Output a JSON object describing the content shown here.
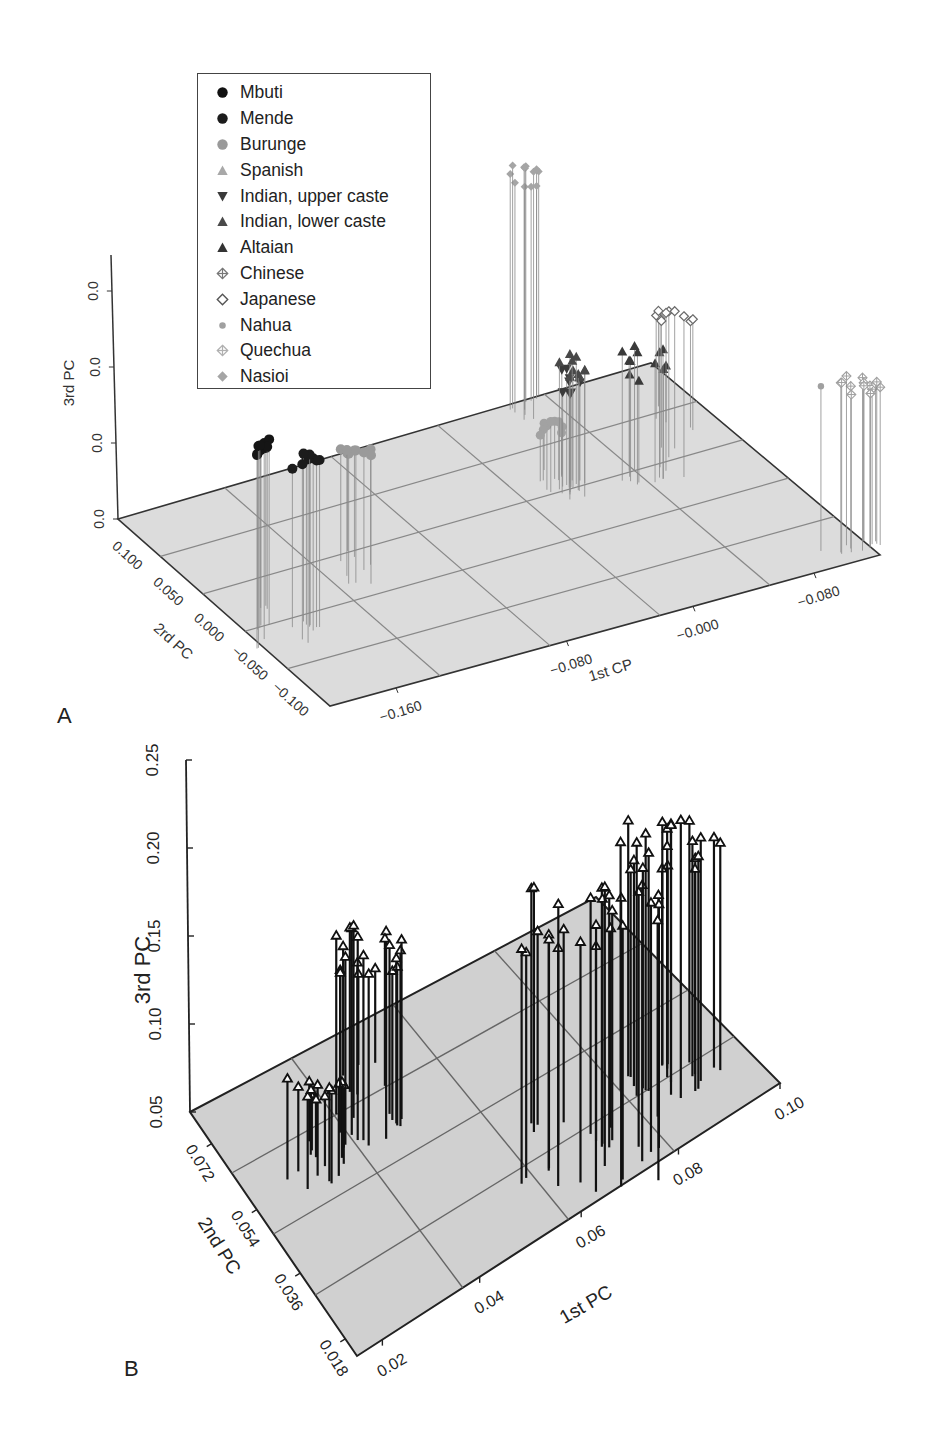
{
  "panels": [
    {
      "letter": "A"
    },
    {
      "letter": "B"
    }
  ],
  "legend": {
    "items": [
      {
        "label": "Mbuti",
        "symbol": "filled-circle",
        "color": "#111111"
      },
      {
        "label": "Mende",
        "symbol": "filled-circle",
        "color": "#1c1c1c"
      },
      {
        "label": "Burunge",
        "symbol": "filled-circle",
        "color": "#9a9a9a"
      },
      {
        "label": "Spanish",
        "symbol": "triangle-up",
        "color": "#a8a8a8"
      },
      {
        "label": "Indian, upper caste",
        "symbol": "triangle-down",
        "color": "#3a3a3a"
      },
      {
        "label": "Indian, lower caste",
        "symbol": "triangle-up",
        "color": "#4a4a4a"
      },
      {
        "label": "Altaian",
        "symbol": "triangle-up",
        "color": "#333333"
      },
      {
        "label": "Chinese",
        "symbol": "crossed-diamond",
        "color": "#777777"
      },
      {
        "label": "Japanese",
        "symbol": "open-diamond",
        "color": "#555555"
      },
      {
        "label": "Nahua",
        "symbol": "small-circle",
        "color": "#a0a0a0"
      },
      {
        "label": "Quechua",
        "symbol": "crossed-diamond",
        "color": "#b0b0b0"
      },
      {
        "label": "Nasioi",
        "symbol": "filled-diamond",
        "color": "#a5a5a5"
      }
    ]
  },
  "chart_data": [
    {
      "panel": "A",
      "type": "scatter",
      "subtype": "3d-stem",
      "title": "",
      "xlabel": "1st CP",
      "ylabel": "2rd PC",
      "zlabel": "3rd PC",
      "x_ticks": [
        "-0.160",
        "-0.080",
        "-0.000",
        "-0.080"
      ],
      "y_ticks": [
        "0.100",
        "0.050",
        "0.000",
        "-0.050",
        "-0.100"
      ],
      "z_ticks": [
        "0.0",
        "0.0",
        "0.0",
        "0.0"
      ],
      "grid": true,
      "legend_position": "upper-left",
      "series": [
        {
          "name": "Mbuti",
          "approx_center": {
            "x": -0.17,
            "y": 0.03,
            "z_rel": 0.34
          }
        },
        {
          "name": "Mende",
          "approx_center": {
            "x": -0.16,
            "y": 0.0,
            "z_rel": 0.33
          }
        },
        {
          "name": "Burunge",
          "approx_center": {
            "x": -0.135,
            "y": 0.02,
            "z_rel": 0.33
          }
        },
        {
          "name": "Spanish",
          "approx_center": {
            "x": -0.05,
            "y": 0.04,
            "z_rel": 0.3
          }
        },
        {
          "name": "Indian, upper caste",
          "approx_center": {
            "x": -0.04,
            "y": 0.05,
            "z_rel": 0.55
          }
        },
        {
          "name": "Indian, lower caste",
          "approx_center": {
            "x": -0.04,
            "y": 0.05,
            "z_rel": 0.58
          }
        },
        {
          "name": "Altaian",
          "approx_center": {
            "x": 0.0,
            "y": 0.07,
            "z_rel": 0.6
          }
        },
        {
          "name": "Japanese",
          "approx_center": {
            "x": 0.02,
            "y": 0.08,
            "z_rel": 0.75
          }
        },
        {
          "name": "Chinese",
          "approx_center": {
            "x": 0.02,
            "y": 0.08,
            "z_rel": 0.75
          }
        },
        {
          "name": "Nasioi",
          "approx_center": {
            "x": -0.05,
            "y": 0.1,
            "z_rel": 1.05
          }
        },
        {
          "name": "Nahua",
          "approx_center": {
            "x": 0.07,
            "y": -0.05,
            "z_rel": 0.52
          }
        },
        {
          "name": "Quechua",
          "approx_center": {
            "x": 0.08,
            "y": -0.06,
            "z_rel": 0.52
          }
        }
      ]
    },
    {
      "panel": "B",
      "type": "scatter",
      "subtype": "3d-stem",
      "title": "",
      "xlabel": "1st PC",
      "ylabel": "2nd PC",
      "zlabel": "3rd PC",
      "x_ticks": [
        "0.02",
        "0.04",
        "0.06",
        "0.08",
        "0.10"
      ],
      "y_ticks": [
        "0.018",
        "0.036",
        "0.054",
        "0.072"
      ],
      "z_ticks": [
        "0.05",
        "0.10",
        "0.15",
        "0.20",
        "0.25"
      ],
      "zlim": [
        0.05,
        0.25
      ],
      "xlim": [
        0.01,
        0.1
      ],
      "ylim": [
        0.018,
        0.09
      ],
      "grid": true,
      "legend_position": "none",
      "series": [
        {
          "name": "cluster-left-low",
          "approx_center": {
            "x": 0.02,
            "y": 0.06,
            "z": 0.09
          }
        },
        {
          "name": "cluster-left-high",
          "approx_center": {
            "x": 0.03,
            "y": 0.07,
            "z": 0.14
          }
        },
        {
          "name": "cluster-right-mid",
          "approx_center": {
            "x": 0.07,
            "y": 0.06,
            "z": 0.15
          }
        },
        {
          "name": "cluster-right-high",
          "approx_center": {
            "x": 0.085,
            "y": 0.06,
            "z": 0.21
          }
        }
      ]
    }
  ],
  "axes_a": {
    "xlabel": "1st CP",
    "ylabel": "2rd PC",
    "zlabel": "3rd PC",
    "x_ticks": [
      "−0.160",
      "−0.080",
      "−0.000",
      "−0.080"
    ],
    "y_ticks": [
      "0.100",
      "0.050",
      "0.000",
      "−0.050",
      "−0.100"
    ],
    "z_ticks": [
      "0.0",
      "0.0",
      "0.0",
      "0.0"
    ]
  },
  "axes_b": {
    "xlabel": "1st PC",
    "ylabel": "2nd PC",
    "zlabel": "3rd PC",
    "x_ticks": [
      "0.02",
      "0.04",
      "0.06",
      "0.08",
      "0.10"
    ],
    "y_ticks": [
      "0.018",
      "0.036",
      "0.054",
      "0.072"
    ],
    "z_ticks": [
      "0.05",
      "0.10",
      "0.15",
      "0.20",
      "0.25"
    ]
  }
}
